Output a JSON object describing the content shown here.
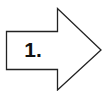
{
  "arrow": {
    "label": "1.",
    "direction": "right",
    "stroke_color": "#222222",
    "fill_color": "#ffffff"
  }
}
